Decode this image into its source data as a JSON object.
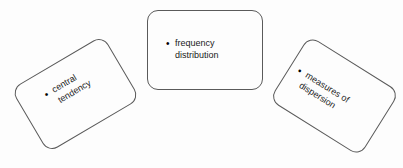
{
  "diagram": {
    "type": "concept-map",
    "background_color": "#fdfdfd",
    "stroke_color": "#5a5a5a",
    "text_color": "#1a1a1a",
    "nodes": [
      {
        "id": "central-tendency",
        "bullet": "•",
        "lines": [
          "central",
          "tendency"
        ],
        "text": "central tendency",
        "rotation_deg": -30.5
      },
      {
        "id": "frequency-distribution",
        "bullet": "•",
        "lines": [
          "frequency",
          "distribution"
        ],
        "text": "frequency distribution",
        "rotation_deg": 0
      },
      {
        "id": "measures-of-dispersion",
        "bullet": "•",
        "lines": [
          "measures of",
          "dispersion"
        ],
        "text": "measures of dispersion",
        "rotation_deg": 32
      }
    ]
  }
}
